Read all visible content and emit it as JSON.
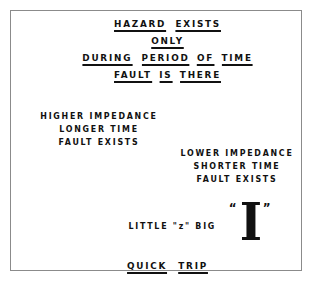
{
  "slide": {
    "background_color": "#ffffff",
    "border_color": "#8b8b8b",
    "text_color": "#111111",
    "heading": {
      "line1": [
        "HAZARD",
        "EXISTS"
      ],
      "line2": [
        "ONLY"
      ],
      "line3": [
        "DURING",
        "PERIOD",
        "OF",
        "TIME"
      ],
      "line4": [
        "FAULT",
        "IS",
        "THERE"
      ]
    },
    "left_block": {
      "line1": "HIGHER IMPEDANCE",
      "line2": "LONGER TIME",
      "line3": "FAULT EXISTS"
    },
    "right_block": {
      "line1": "LOWER IMPEDANCE",
      "line2": "SHORTER TIME",
      "line3": "FAULT EXISTS"
    },
    "emphasis_row": {
      "text": "LITTLE \"z\" BIG",
      "big_symbol": "I",
      "quote_left": "“",
      "quote_right": "”"
    },
    "bottom": {
      "words": [
        "QUICK",
        "TRIP"
      ]
    }
  }
}
